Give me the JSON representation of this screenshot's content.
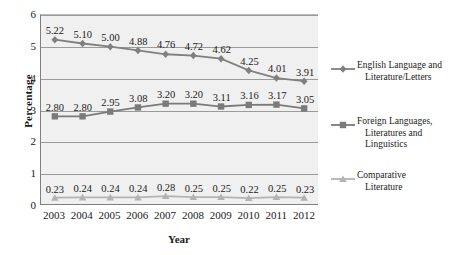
{
  "chart_data": {
    "type": "line",
    "title": "",
    "xlabel": "Year",
    "ylabel": "Percentage",
    "categories": [
      "2003",
      "2004",
      "2005",
      "2006",
      "2007",
      "2008",
      "2009",
      "2010",
      "2011",
      "2012"
    ],
    "ylim": [
      0,
      6
    ],
    "yticks": [
      "0",
      "1",
      "2",
      "3",
      "4",
      "5",
      "6"
    ],
    "grid": true,
    "legend_position": "right",
    "series": [
      {
        "name": "English Language and Literature/Letters",
        "name_line1": "English Language and",
        "name_line2": "Literature/Letters",
        "marker": "diamond",
        "color": "#808080",
        "values": [
          5.22,
          5.1,
          5.0,
          4.88,
          4.76,
          4.72,
          4.62,
          4.25,
          4.01,
          3.91
        ],
        "labels": [
          "5.22",
          "5.10",
          "5.00",
          "4.88",
          "4.76",
          "4.72",
          "4.62",
          "4.25",
          "4.01",
          "3.91"
        ]
      },
      {
        "name": "Foreign Languages, Literatures and Linguistics",
        "name_line1": "Foreign Languages,",
        "name_line2": "Literatures and",
        "name_line3": "Linguistics",
        "marker": "square",
        "color": "#7a7a7a",
        "values": [
          2.8,
          2.8,
          2.95,
          3.08,
          3.2,
          3.2,
          3.11,
          3.16,
          3.17,
          3.05
        ],
        "labels": [
          "2.80",
          "2.80",
          "2.95",
          "3.08",
          "3.20",
          "3.20",
          "3.11",
          "3.16",
          "3.17",
          "3.05"
        ]
      },
      {
        "name": "Comparative Literature",
        "name_line1": "Comparative",
        "name_line2": "Literature",
        "marker": "triangle",
        "color": "#b3b3b3",
        "values": [
          0.23,
          0.24,
          0.24,
          0.24,
          0.28,
          0.25,
          0.25,
          0.22,
          0.25,
          0.23
        ],
        "labels": [
          "0.23",
          "0.24",
          "0.24",
          "0.24",
          "0.28",
          "0.25",
          "0.25",
          "0.22",
          "0.25",
          "0.23"
        ]
      }
    ],
    "colors": {
      "plot_background": "#f0f0f0",
      "gridline": "#9a9a9a",
      "axis": "#7f7f7f",
      "text": "#1a1a1a"
    }
  }
}
